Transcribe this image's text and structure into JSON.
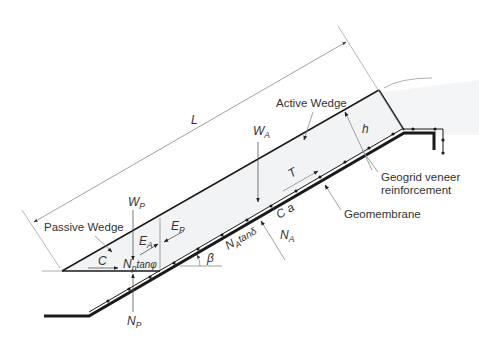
{
  "diagram": {
    "labels": {
      "length": "L",
      "active_wedge": "Active Wedge",
      "passive_wedge": "Passive Wedge",
      "thickness": "h",
      "geogrid": "Geogrid veneer",
      "geogrid_line2": "reinforcement",
      "geomembrane": "Geomembrane",
      "slope_angle": "β"
    },
    "forces": {
      "W_A": {
        "main": "W",
        "sub": "A"
      },
      "W_P": {
        "main": "W",
        "sub": "P"
      },
      "E_A": {
        "main": "E",
        "sub": "A"
      },
      "E_P": {
        "main": "E",
        "sub": "P"
      },
      "N_A": {
        "main": "N",
        "sub": "A"
      },
      "N_P": {
        "main": "N",
        "sub": "P"
      },
      "N_A_tan": {
        "main": "N",
        "sub": "A",
        "tail": "tanδ"
      },
      "N_P_tan": {
        "main": "N",
        "sub": "p",
        "tail": "tanφ"
      },
      "T": "T",
      "C": "C",
      "Ca": "C a"
    },
    "colors": {
      "line": "#1a1a1a",
      "thin": "#888888",
      "fill": "#f1f3f5",
      "text": "#333333"
    }
  }
}
